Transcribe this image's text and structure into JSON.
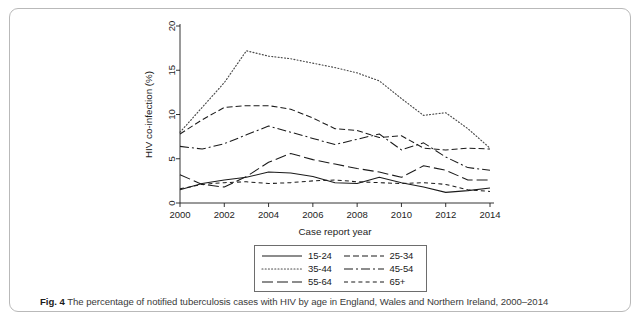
{
  "figure": {
    "caption_prefix": "Fig. 4",
    "caption_text": "The percentage of notified tuberculosis cases with HIV by age in England, Wales and Northern Ireland, 2000–2014"
  },
  "axes": {
    "y_label": "HIV co-infection (%)",
    "x_label": "Case report year",
    "y_ticks": [
      "0",
      "5",
      "10",
      "15",
      "20"
    ],
    "x_ticks": [
      "2000",
      "2002",
      "2004",
      "2006",
      "2008",
      "2010",
      "2012",
      "2014"
    ]
  },
  "legend": {
    "entries": [
      {
        "label": "15-24",
        "style": "solid"
      },
      {
        "label": "25-34",
        "style": "dash-short"
      },
      {
        "label": "35-44",
        "style": "dotted"
      },
      {
        "label": "45-54",
        "style": "dash-dot"
      },
      {
        "label": "55-64",
        "style": "dash-long"
      },
      {
        "label": "65+",
        "style": "dash-medium"
      }
    ]
  },
  "chart_data": {
    "type": "line",
    "title": "",
    "xlabel": "Case report year",
    "ylabel": "HIV co-infection (%)",
    "xlim": [
      2000,
      2014
    ],
    "ylim": [
      0,
      20
    ],
    "yticks": [
      0,
      5,
      10,
      15,
      20
    ],
    "xticks": [
      2000,
      2002,
      2004,
      2006,
      2008,
      2010,
      2012,
      2014
    ],
    "grid": false,
    "legend_position": "below-center",
    "x": [
      2000,
      2001,
      2002,
      2003,
      2004,
      2005,
      2006,
      2007,
      2008,
      2009,
      2010,
      2011,
      2012,
      2013,
      2014
    ],
    "series": [
      {
        "name": "15-24",
        "style": "solid",
        "color": "#1b1b1b",
        "values": [
          1.5,
          2.2,
          2.6,
          2.9,
          3.5,
          3.4,
          3.0,
          2.3,
          2.2,
          2.9,
          2.3,
          1.8,
          1.2,
          1.4,
          1.7
        ]
      },
      {
        "name": "25-34",
        "style": "dash-short",
        "color": "#1b1b1b",
        "values": [
          7.8,
          9.4,
          10.8,
          11.0,
          11.0,
          10.6,
          9.6,
          8.4,
          8.2,
          7.4,
          7.6,
          6.2,
          6.0,
          6.2,
          6.1
        ]
      },
      {
        "name": "35-44",
        "style": "dotted",
        "color": "#4a4a4a",
        "values": [
          8.0,
          10.8,
          13.6,
          17.2,
          16.6,
          16.3,
          15.8,
          15.3,
          14.7,
          13.8,
          11.8,
          9.9,
          10.2,
          8.4,
          6.2
        ]
      },
      {
        "name": "45-54",
        "style": "dash-dot",
        "color": "#1b1b1b",
        "values": [
          6.4,
          6.1,
          6.7,
          7.7,
          8.7,
          8.0,
          7.3,
          6.6,
          7.2,
          7.8,
          6.0,
          6.8,
          5.2,
          4.0,
          3.7
        ]
      },
      {
        "name": "55-64",
        "style": "dash-long",
        "color": "#1b1b1b",
        "values": [
          3.2,
          2.1,
          1.8,
          3.0,
          4.6,
          5.6,
          4.9,
          4.4,
          3.9,
          3.5,
          2.9,
          4.2,
          3.7,
          2.6,
          2.6
        ]
      },
      {
        "name": "65+",
        "style": "dash-medium",
        "color": "#1b1b1b",
        "values": [
          1.6,
          2.1,
          2.3,
          2.4,
          2.2,
          2.3,
          2.5,
          2.6,
          2.4,
          2.3,
          2.2,
          2.3,
          2.1,
          1.5,
          1.3
        ]
      }
    ]
  }
}
